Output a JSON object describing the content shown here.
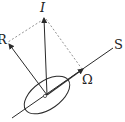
{
  "diagram": {
    "type": "vector-diagram",
    "labels": {
      "I": "I",
      "R": "R",
      "S": "S",
      "Omega": "Ω"
    },
    "colors": {
      "stroke": "#2a2a2a",
      "dashed": "#666666",
      "background": "#ffffff"
    },
    "vectors": [
      {
        "name": "I",
        "from": [
          47,
          95
        ],
        "to": [
          44,
          17
        ]
      },
      {
        "name": "R",
        "from": [
          47,
          95
        ],
        "to": [
          9,
          44
        ]
      },
      {
        "name": "Omega",
        "from": [
          47,
          95
        ],
        "to": [
          82,
          70
        ]
      }
    ],
    "axis": {
      "name": "S",
      "from": [
        12,
        118
      ],
      "to": [
        113,
        48
      ]
    }
  }
}
